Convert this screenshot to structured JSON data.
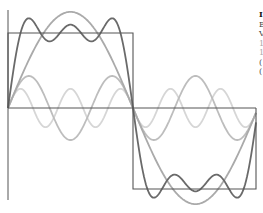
{
  "diagram": {
    "origin": {
      "x": 8,
      "y": 108
    },
    "half_period_px": 125,
    "unit_amplitude_px": 75.5,
    "axes": {
      "x_axis": {
        "x1": 8,
        "x2": 256,
        "y": 108
      },
      "y_axis": {
        "x": 8,
        "y1": 10,
        "y2": 200
      }
    },
    "curves": [
      {
        "name": "square-wave",
        "label": "Square wave",
        "color": "#555555",
        "width": 1.1
      },
      {
        "name": "fundamental",
        "label": "sin(x)",
        "harmonics": [
          1
        ],
        "color": "#aaaaaa",
        "width": 1.8
      },
      {
        "name": "third-harmonic",
        "label": "sin(3x)/3",
        "harmonics": [
          3
        ],
        "color": "#bdbdbd",
        "width": 1.8
      },
      {
        "name": "fifth-harmonic",
        "label": "sin(5x)/5",
        "harmonics": [
          5
        ],
        "color": "#d6d6d6",
        "width": 1.8
      },
      {
        "name": "partial-sum",
        "label": "sin(x)+sin(3x)/3+sin(5x)/5",
        "harmonics": [
          1,
          3,
          5
        ],
        "color": "#6a6a6a",
        "width": 1.8
      }
    ]
  },
  "caption": {
    "lines": [
      "I",
      "E",
      "V",
      "1",
      "1",
      "(",
      "("
    ]
  }
}
